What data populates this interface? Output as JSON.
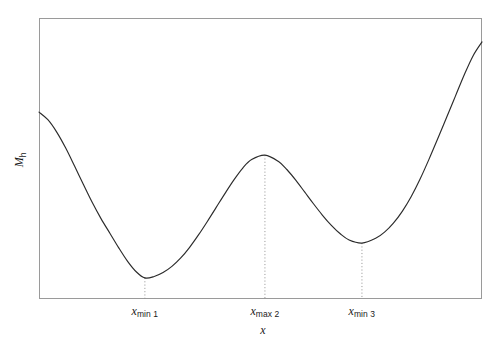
{
  "figure": {
    "background_color": "#ffffff",
    "frame_color": "#9a9a9a",
    "curve_color": "#2b2b2b",
    "guide_color": "#8f8f8f"
  },
  "axes": {
    "ylabel_symbol": "M",
    "ylabel_subscript": "h",
    "xlabel_symbol": "x"
  },
  "ticks": [
    {
      "symbol": "x",
      "subscript": "min 1"
    },
    {
      "symbol": "x",
      "subscript": "max 2"
    },
    {
      "symbol": "x",
      "subscript": "min 3"
    }
  ],
  "chart_data": {
    "type": "line",
    "title": "",
    "subtitle": "",
    "xlabel": "x",
    "ylabel": "M_h",
    "grid": false,
    "legend": false,
    "legend_position": "none",
    "xlim": [
      0,
      100
    ],
    "ylim": [
      0,
      100
    ],
    "axis_tick_labels_x": [
      "x_min 1",
      "x_max 2",
      "x_min 3"
    ],
    "axis_tick_labels_y": [],
    "annotations": [
      {
        "label": "x_min 1",
        "kind": "local-minimum",
        "x": 23.9,
        "y": 7.5
      },
      {
        "label": "x_max 2",
        "kind": "local-maximum",
        "x": 51.0,
        "y": 51.2
      },
      {
        "label": "x_min 3",
        "kind": "local-minimum",
        "x": 72.9,
        "y": 19.9
      }
    ],
    "guide_lines": [
      {
        "type": "vertical-dotted",
        "x": 23.9,
        "from_y": 0,
        "to_y": 7.5
      },
      {
        "type": "vertical-dotted",
        "x": 51.0,
        "from_y": 0,
        "to_y": 51.2
      },
      {
        "type": "vertical-dotted",
        "x": 72.9,
        "from_y": 0,
        "to_y": 19.9
      }
    ],
    "series": [
      {
        "name": "M_h(x)",
        "x": [
          0.0,
          2.0,
          4.0,
          6.0,
          8.0,
          10.0,
          12.0,
          14.0,
          16.0,
          18.0,
          20.0,
          22.0,
          23.9,
          26.0,
          28.0,
          30.0,
          32.0,
          34.0,
          36.0,
          38.0,
          40.0,
          42.0,
          44.0,
          46.0,
          48.0,
          51.0,
          54.0,
          56.0,
          58.0,
          60.0,
          62.0,
          64.0,
          66.0,
          68.0,
          70.0,
          72.9,
          76.0,
          78.0,
          80.0,
          82.0,
          84.0,
          86.0,
          88.0,
          90.0,
          92.0,
          94.0,
          96.0,
          98.0,
          100.0
        ],
        "y": [
          66.5,
          63.8,
          59.4,
          53.8,
          47.4,
          40.8,
          34.4,
          28.6,
          23.4,
          18.2,
          13.4,
          9.6,
          7.5,
          8.0,
          9.4,
          11.6,
          14.6,
          18.4,
          22.8,
          27.6,
          32.6,
          37.6,
          42.4,
          46.6,
          49.6,
          51.2,
          49.0,
          46.0,
          42.2,
          38.0,
          33.8,
          29.8,
          26.2,
          23.2,
          21.0,
          19.9,
          21.6,
          23.8,
          27.0,
          31.2,
          36.4,
          42.6,
          49.6,
          57.0,
          64.6,
          72.2,
          79.8,
          86.6,
          91.5
        ]
      }
    ]
  }
}
